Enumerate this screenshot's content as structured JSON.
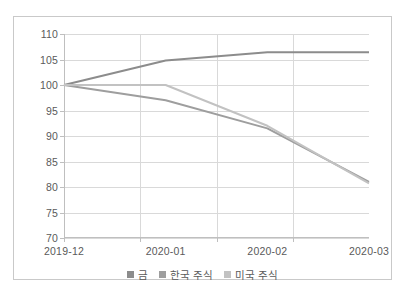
{
  "chart_data": {
    "type": "line",
    "title": "",
    "xlabel": "",
    "ylabel": "",
    "categories": [
      "2019-12",
      "2020-01",
      "2020-02",
      "2020-03"
    ],
    "ylim": [
      70,
      110
    ],
    "yticks": [
      70,
      75,
      80,
      85,
      90,
      95,
      100,
      105,
      110
    ],
    "ytick_labels": [
      "70",
      "75",
      "80",
      "85",
      "90",
      "95",
      "100",
      "105",
      "110"
    ],
    "grid": true,
    "legend_position": "bottom",
    "series": [
      {
        "name": "금",
        "color": "#8c8c8c",
        "values": [
          100,
          104.8,
          106.4,
          106.4
        ]
      },
      {
        "name": "한국 주식",
        "color": "#9e9e9e",
        "values": [
          100,
          97.0,
          91.5,
          81.0
        ]
      },
      {
        "name": "미국 주식",
        "color": "#c2c2c2",
        "values": [
          100,
          100.0,
          92.0,
          80.7
        ]
      }
    ]
  },
  "colors": {
    "frame_border": "#c9c9c9",
    "gridline": "#d9d9d9",
    "axis": "#bfbfbf",
    "tick_text": "#5a5a5a",
    "background": "#ffffff"
  }
}
